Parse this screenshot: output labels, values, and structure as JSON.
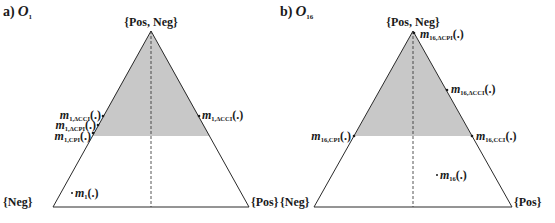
{
  "colors": {
    "shade": "#c8c8c8",
    "line": "#2a2a2a",
    "background": "#ffffff"
  },
  "panels": [
    {
      "id": "a",
      "title_prefix": "a)",
      "title_symbol": "O",
      "title_sub": "1",
      "vertices": {
        "top": "{Pos, Neg}",
        "left": "{Neg}",
        "right": "{Pos}"
      },
      "points": [
        {
          "m": "m",
          "sub": "1,ΔCCI",
          "tail": "(.)",
          "side": "left-edge-upper"
        },
        {
          "m": "m",
          "sub": "1,ΔCPI",
          "tail": "(.)",
          "side": "left-edge-middle"
        },
        {
          "m": "m",
          "sub": "1,CPI",
          "tail": "(.)",
          "side": "left-edge-lower"
        },
        {
          "m": "m",
          "sub": "1,ΔCCI",
          "tail": "(.)",
          "side": "right-edge"
        },
        {
          "m": "m",
          "sub": "1",
          "tail": "(.)",
          "side": "interior"
        }
      ]
    },
    {
      "id": "b",
      "title_prefix": "b)",
      "title_symbol": "O",
      "title_sub": "16",
      "vertices": {
        "top": "{Pos, Neg}",
        "left": "{Neg}",
        "right": "{Pos}"
      },
      "points": [
        {
          "m": "m",
          "sub": "16,ΔCPI",
          "tail": "(.)",
          "side": "apex"
        },
        {
          "m": "m",
          "sub": "16,ΔCCI",
          "tail": "(.)",
          "side": "right-edge-upper"
        },
        {
          "m": "m",
          "sub": "16,CPI",
          "tail": "(.)",
          "side": "left-edge"
        },
        {
          "m": "m",
          "sub": "16,CCI",
          "tail": "(.)",
          "side": "right-edge-lower"
        },
        {
          "m": "m",
          "sub": "16",
          "tail": "(.)",
          "side": "interior"
        }
      ]
    }
  ]
}
